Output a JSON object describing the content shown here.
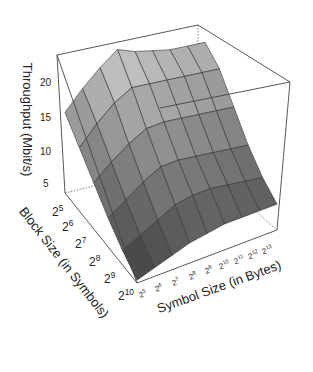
{
  "chart_data": {
    "type": "surface3d",
    "title": "",
    "zlabel": "Throughput (Mbit/s)",
    "ylabel": "Block Size (in Symbols)",
    "xlabel": "Symbol Size (in Bytes)",
    "z_ticks": [
      "5",
      "10",
      "15",
      "20"
    ],
    "zlim": [
      0,
      24
    ],
    "block_size_ticks": [
      "2^5",
      "2^6",
      "2^7",
      "2^8",
      "2^9",
      "2^10"
    ],
    "symbol_size_ticks": [
      "2^5",
      "2^6",
      "2^7",
      "2^8",
      "2^9",
      "2^10",
      "2^11",
      "2^12",
      "2^13"
    ],
    "block_sizes": [
      32,
      64,
      128,
      256,
      512,
      1024
    ],
    "symbol_sizes": [
      32,
      64,
      128,
      256,
      512,
      1024,
      2048,
      4096,
      8192
    ],
    "throughput": [
      [
        14,
        17,
        19.5,
        21.5,
        20,
        19,
        18,
        17.5,
        17
      ],
      [
        11,
        14,
        16.5,
        18,
        17.5,
        17,
        16.5,
        16,
        15.5
      ],
      [
        8,
        10.5,
        12.5,
        14,
        14,
        13.5,
        13,
        12.5,
        12
      ],
      [
        5,
        7,
        9,
        10.5,
        10.5,
        10,
        9.5,
        9,
        8.5
      ],
      [
        2.5,
        4,
        5.5,
        7,
        7.5,
        7.5,
        7,
        6.5,
        6
      ],
      [
        0.5,
        1.5,
        2.5,
        3.5,
        4,
        4.5,
        4.5,
        4.5,
        4.5
      ]
    ],
    "grid": false,
    "legend": "none"
  },
  "labels": {
    "z_title": "Throughput (Mbit/s)",
    "block_title": "Block Size (in Symbols)",
    "symbol_title": "Symbol Size (in Bytes)",
    "z5": "5",
    "z10": "10",
    "z15": "15",
    "z20": "20"
  }
}
